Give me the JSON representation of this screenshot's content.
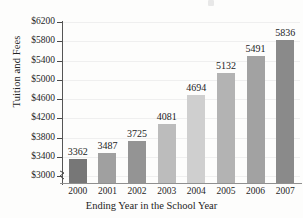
{
  "chart_data": {
    "type": "bar",
    "title": "",
    "xlabel": "Ending Year in the School Year",
    "ylabel": "Tuition and Fees",
    "categories": [
      "2000",
      "2001",
      "2002",
      "2003",
      "2004",
      "2005",
      "2006",
      "2007"
    ],
    "values": [
      3362,
      3487,
      3725,
      4081,
      4694,
      5132,
      5491,
      5836
    ],
    "value_labels": [
      "3362",
      "3487",
      "3725",
      "4081",
      "4694",
      "5132",
      "5491",
      "5836"
    ],
    "ytick_labels": [
      "$6200",
      "$5800",
      "$5400",
      "$5000",
      "$4600",
      "$4200",
      "$3800",
      "$3400",
      "$3000"
    ],
    "ytick_values": [
      6200,
      5800,
      5400,
      5000,
      4600,
      4200,
      3800,
      3400,
      3000
    ],
    "ylim": [
      2860,
      6200
    ],
    "ytick_step": 400,
    "grid": true,
    "axis_break": true,
    "legend": "none",
    "bar_colors": [
      "#777777",
      "#a0a0a0",
      "#949494",
      "#bcbcbc",
      "#cfcfcf",
      "#b3b3b3",
      "#a2a2a2",
      "#8a8a8a"
    ]
  }
}
